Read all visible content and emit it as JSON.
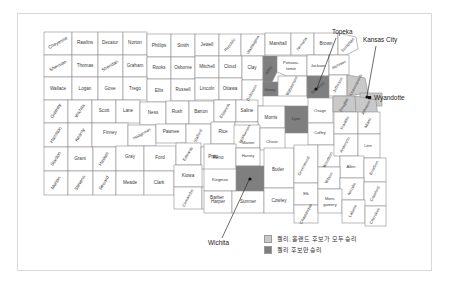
{
  "figure": {
    "title": "",
    "width": 450,
    "height": 290
  },
  "colors": {
    "win_both": "#c9c9c9",
    "win_kelly": "#7f7f7f",
    "county_fill": "#ffffff",
    "county_stroke": "#8c8c8c",
    "frame_stroke": "#d8d8d8",
    "text": "#2a2a2a"
  },
  "legend": {
    "items": [
      {
        "label": "켈리, 홀랜드 후보가 모두 승리",
        "swatch": "win_both"
      },
      {
        "label": "켈리 후보만 승리",
        "swatch": "win_kelly"
      }
    ]
  },
  "callouts": [
    {
      "name": "topeka",
      "label": "Topeka"
    },
    {
      "name": "kansas-city",
      "label": "Kansas City"
    },
    {
      "name": "wyandotte",
      "label": "Wyandotte"
    },
    {
      "name": "wichita",
      "label": "Wichita"
    }
  ],
  "map": {
    "region": "Kansas",
    "counties": [
      {
        "name": "Cheyenne",
        "status": "none"
      },
      {
        "name": "Rawlins",
        "status": "none"
      },
      {
        "name": "Decatur",
        "status": "none"
      },
      {
        "name": "Norton",
        "status": "none"
      },
      {
        "name": "Phillips",
        "status": "none"
      },
      {
        "name": "Smith",
        "status": "none"
      },
      {
        "name": "Jewell",
        "status": "none"
      },
      {
        "name": "Republic",
        "status": "none"
      },
      {
        "name": "Washington",
        "status": "none"
      },
      {
        "name": "Marshall",
        "status": "none"
      },
      {
        "name": "Nemaha",
        "status": "none"
      },
      {
        "name": "Brown",
        "status": "none"
      },
      {
        "name": "Doniphan",
        "status": "none"
      },
      {
        "name": "Sherman",
        "status": "none"
      },
      {
        "name": "Thomas",
        "status": "none"
      },
      {
        "name": "Sheridan",
        "status": "none"
      },
      {
        "name": "Graham",
        "status": "none"
      },
      {
        "name": "Rooks",
        "status": "none"
      },
      {
        "name": "Osborne",
        "status": "none"
      },
      {
        "name": "Mitchell",
        "status": "none"
      },
      {
        "name": "Cloud",
        "status": "none"
      },
      {
        "name": "Clay",
        "status": "none"
      },
      {
        "name": "Riley",
        "status": "win_kelly"
      },
      {
        "name": "Pottawatomie",
        "status": "none"
      },
      {
        "name": "Jackson",
        "status": "none"
      },
      {
        "name": "Atchison",
        "status": "none"
      },
      {
        "name": "Leavenworth",
        "status": "win_both"
      },
      {
        "name": "Wyandotte",
        "status": "win_both"
      },
      {
        "name": "Wallace",
        "status": "none"
      },
      {
        "name": "Logan",
        "status": "none"
      },
      {
        "name": "Gove",
        "status": "none"
      },
      {
        "name": "Trego",
        "status": "none"
      },
      {
        "name": "Ellis",
        "status": "none"
      },
      {
        "name": "Russell",
        "status": "none"
      },
      {
        "name": "Lincoln",
        "status": "none"
      },
      {
        "name": "Ottawa",
        "status": "none"
      },
      {
        "name": "Dickinson",
        "status": "none"
      },
      {
        "name": "Geary",
        "status": "win_kelly"
      },
      {
        "name": "Wabaunsee",
        "status": "none"
      },
      {
        "name": "Shawnee",
        "status": "win_kelly"
      },
      {
        "name": "Jefferson",
        "status": "none"
      },
      {
        "name": "Douglas",
        "status": "win_both"
      },
      {
        "name": "Johnson",
        "status": "win_both"
      },
      {
        "name": "Greeley",
        "status": "none"
      },
      {
        "name": "Wichita",
        "status": "none"
      },
      {
        "name": "Scott",
        "status": "none"
      },
      {
        "name": "Lane",
        "status": "none"
      },
      {
        "name": "Ness",
        "status": "none"
      },
      {
        "name": "Rush",
        "status": "none"
      },
      {
        "name": "Barton",
        "status": "none"
      },
      {
        "name": "Ellsworth",
        "status": "none"
      },
      {
        "name": "Saline",
        "status": "none"
      },
      {
        "name": "Morris",
        "status": "none"
      },
      {
        "name": "Lyon",
        "status": "win_kelly"
      },
      {
        "name": "Osage",
        "status": "none"
      },
      {
        "name": "Franklin",
        "status": "none"
      },
      {
        "name": "Miami",
        "status": "none"
      },
      {
        "name": "Hamilton",
        "status": "none"
      },
      {
        "name": "Kearny",
        "status": "none"
      },
      {
        "name": "Finney",
        "status": "none"
      },
      {
        "name": "Hodgeman",
        "status": "none"
      },
      {
        "name": "Pawnee",
        "status": "none"
      },
      {
        "name": "Stafford",
        "status": "none"
      },
      {
        "name": "Rice",
        "status": "none"
      },
      {
        "name": "McPherson",
        "status": "none"
      },
      {
        "name": "Marion",
        "status": "none"
      },
      {
        "name": "Chase",
        "status": "none"
      },
      {
        "name": "Coffey",
        "status": "none"
      },
      {
        "name": "Anderson",
        "status": "none"
      },
      {
        "name": "Linn",
        "status": "none"
      },
      {
        "name": "Stanton",
        "status": "none"
      },
      {
        "name": "Grant",
        "status": "none"
      },
      {
        "name": "Haskell",
        "status": "none"
      },
      {
        "name": "Gray",
        "status": "none"
      },
      {
        "name": "Ford",
        "status": "none"
      },
      {
        "name": "Edwards",
        "status": "none"
      },
      {
        "name": "Pratt",
        "status": "none"
      },
      {
        "name": "Reno",
        "status": "none"
      },
      {
        "name": "Harvey",
        "status": "none"
      },
      {
        "name": "Butler",
        "status": "none"
      },
      {
        "name": "Greenwood",
        "status": "none"
      },
      {
        "name": "Woodson",
        "status": "none"
      },
      {
        "name": "Allen",
        "status": "none"
      },
      {
        "name": "Bourbon",
        "status": "none"
      },
      {
        "name": "Morton",
        "status": "none"
      },
      {
        "name": "Stevens",
        "status": "none"
      },
      {
        "name": "Seward",
        "status": "none"
      },
      {
        "name": "Meade",
        "status": "none"
      },
      {
        "name": "Clark",
        "status": "none"
      },
      {
        "name": "Kiowa",
        "status": "none"
      },
      {
        "name": "Comanche",
        "status": "none"
      },
      {
        "name": "Barber",
        "status": "none"
      },
      {
        "name": "Kingman",
        "status": "none"
      },
      {
        "name": "Sedgwick",
        "status": "win_kelly"
      },
      {
        "name": "Harper",
        "status": "none"
      },
      {
        "name": "Sumner",
        "status": "none"
      },
      {
        "name": "Cowley",
        "status": "none"
      },
      {
        "name": "Elk",
        "status": "none"
      },
      {
        "name": "Wilson",
        "status": "none"
      },
      {
        "name": "Neosho",
        "status": "none"
      },
      {
        "name": "Crawford",
        "status": "none"
      },
      {
        "name": "Chautauqua",
        "status": "none"
      },
      {
        "name": "Montgomery",
        "status": "none"
      },
      {
        "name": "Labette",
        "status": "none"
      },
      {
        "name": "Cherokee",
        "status": "none"
      }
    ]
  }
}
